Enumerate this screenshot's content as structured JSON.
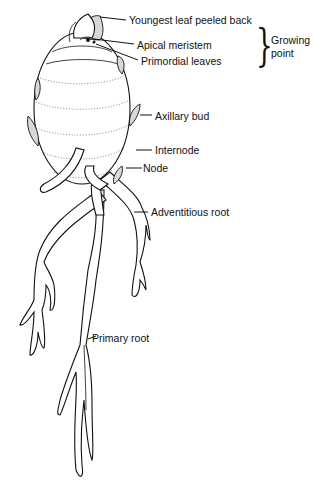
{
  "diagram": {
    "labels": {
      "youngest_leaf": "Youngest leaf peeled back",
      "apical_meristem": "Apical meristem",
      "primordial_leaves": "Primordial leaves",
      "growing_point": "Growing point",
      "growing_point_line1": "Growing",
      "growing_point_line2": "point",
      "axillary_bud": "Axillary bud",
      "internode": "Internode",
      "node": "Node",
      "adventitious_root": "Adventitious root",
      "primary_root": "Primary root"
    },
    "brace_glyph": "}",
    "colors": {
      "line": "#111111",
      "background": "#ffffff",
      "shading": "#d8d8d8"
    }
  }
}
